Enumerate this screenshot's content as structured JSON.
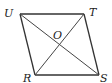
{
  "figure": {
    "type": "rhombus-with-diagonals",
    "line_color": "#333333",
    "vertices": {
      "U": {
        "label": "U",
        "x": 20,
        "y": 14,
        "label_x": 4,
        "label_y": 17
      },
      "T": {
        "label": "T",
        "x": 84,
        "y": 14,
        "label_x": 89,
        "label_y": 16
      },
      "R": {
        "label": "R",
        "x": 35,
        "y": 75,
        "label_x": 23,
        "label_y": 83
      },
      "S": {
        "label": "S",
        "x": 99,
        "y": 75,
        "label_x": 100,
        "label_y": 83
      }
    },
    "intersection": {
      "label": "O",
      "x": 59,
      "y": 45,
      "label_x": 53,
      "label_y": 39
    },
    "sides": [
      "UT",
      "TS",
      "SR",
      "RU"
    ],
    "diagonals": [
      "US",
      "TR"
    ]
  }
}
